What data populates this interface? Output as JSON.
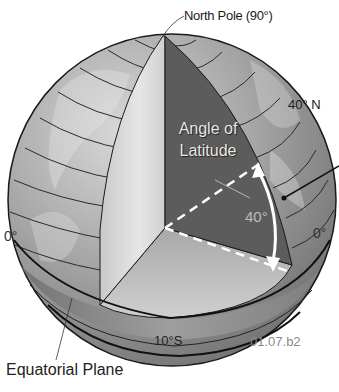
{
  "figure": {
    "type": "globe-cutaway-diagram",
    "subject": "Angle of latitude",
    "labels": {
      "north_pole": "North Pole (90°)",
      "latitude_40n": "40° N",
      "equator_left": "0°",
      "equator_right": "0°",
      "angle_title_line1": "Angle of",
      "angle_title_line2": "Latitude",
      "angle_value": "40°",
      "latitude_10s": "10°S",
      "figure_code": "01.07.b2",
      "equatorial_plane": "Equatorial Plane"
    },
    "angle_degrees": 40,
    "colors": {
      "background": "#ffffff",
      "globe_surface": "#9a9a9a",
      "cut_face_light": "#d4d4d4",
      "cut_face_dark": "#5a5a5a",
      "equatorial_plane_face": "#b8b8b8",
      "outline": "#1a1a1a",
      "dashed_line": "#ffffff",
      "arrow": "#ffffff"
    }
  }
}
